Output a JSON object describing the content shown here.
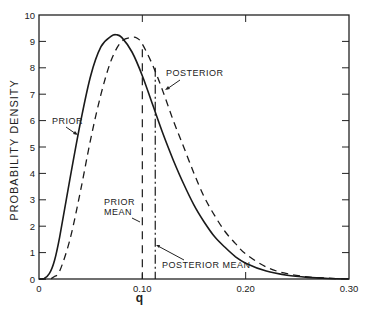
{
  "chart_data": {
    "type": "line",
    "title": "",
    "xlabel": "q",
    "ylabel": "PROBABILITY DENSITY",
    "xlim": [
      0,
      0.3
    ],
    "ylim": [
      0,
      10
    ],
    "grid": false,
    "legend": "none (curves labeled by annotations)",
    "x_ticks": [
      0,
      0.1,
      0.2,
      0.3
    ],
    "x_tick_labels": [
      "0",
      "0.10",
      "0.20",
      "0.30"
    ],
    "y_ticks": [
      0,
      1,
      2,
      3,
      4,
      5,
      6,
      7,
      8,
      9,
      10
    ],
    "y_tick_labels": [
      "0",
      "1",
      "2",
      "3",
      "4",
      "5",
      "6",
      "7",
      "8",
      "9",
      "10"
    ],
    "series": [
      {
        "name": "PRIOR",
        "style": "solid",
        "x": [
          0,
          0.005,
          0.01,
          0.015,
          0.02,
          0.03,
          0.04,
          0.05,
          0.06,
          0.07,
          0.075,
          0.08,
          0.09,
          0.1,
          0.11,
          0.12,
          0.13,
          0.14,
          0.15,
          0.16,
          0.17,
          0.18,
          0.19,
          0.2,
          0.22,
          0.24,
          0.26,
          0.28,
          0.3
        ],
        "values": [
          0,
          0.02,
          0.2,
          0.7,
          1.6,
          3.8,
          5.9,
          7.7,
          8.8,
          9.2,
          9.25,
          9.15,
          8.6,
          7.7,
          6.6,
          5.5,
          4.5,
          3.6,
          2.8,
          2.15,
          1.6,
          1.2,
          0.85,
          0.6,
          0.3,
          0.14,
          0.06,
          0.02,
          0.0
        ]
      },
      {
        "name": "POSTERIOR",
        "style": "dashed",
        "x": [
          0,
          0.01,
          0.015,
          0.02,
          0.03,
          0.04,
          0.05,
          0.06,
          0.07,
          0.08,
          0.09,
          0.095,
          0.1,
          0.11,
          0.12,
          0.13,
          0.14,
          0.15,
          0.16,
          0.17,
          0.18,
          0.19,
          0.2,
          0.22,
          0.24,
          0.26,
          0.28,
          0.3
        ],
        "values": [
          0,
          0.0,
          0.1,
          0.3,
          1.5,
          3.3,
          5.3,
          7.0,
          8.3,
          9.0,
          9.15,
          9.12,
          8.9,
          8.1,
          7.1,
          6.0,
          5.0,
          4.0,
          3.1,
          2.4,
          1.8,
          1.35,
          0.95,
          0.45,
          0.2,
          0.08,
          0.03,
          0.0
        ]
      }
    ],
    "vertical_lines": [
      {
        "name": "PRIOR MEAN",
        "x": 0.1,
        "style": "dashed"
      },
      {
        "name": "POSTERIOR MEAN",
        "x": 0.1125,
        "style": "dash-dot"
      }
    ],
    "annotations": [
      {
        "text": "PRIOR",
        "points_to": "prior curve near q=0.05, density≈5.5"
      },
      {
        "text": "POSTERIOR",
        "points_to": "posterior curve near q=0.125, density≈6.5"
      },
      {
        "text": "PRIOR MEAN",
        "points_to": "prior mean line at q=0.10"
      },
      {
        "text": "POSTERIOR MEAN",
        "points_to": "posterior mean line at q≈0.1125"
      }
    ]
  },
  "labels": {
    "ylabel": "PROBABILITY DENSITY",
    "xlabel": "q",
    "prior": "PRIOR",
    "posterior": "POSTERIOR",
    "prior_mean_1": "PRIOR",
    "prior_mean_2": "MEAN",
    "posterior_mean": "POSTERIOR MEAN"
  }
}
